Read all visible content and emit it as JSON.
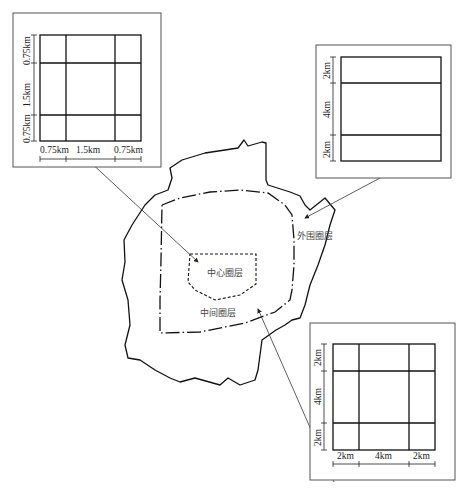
{
  "zones": {
    "center": {
      "label": "中心圈层"
    },
    "middle": {
      "label": "中间圈层"
    },
    "outer": {
      "label": "外围圈层"
    }
  },
  "grid_center": {
    "vertical": [
      "0.75km",
      "1.5km",
      "0.75km"
    ],
    "horizontal": [
      "0.75km",
      "1.5km",
      "0.75km"
    ]
  },
  "grid_outer": {
    "vertical": [
      "2km",
      "4km",
      "2km"
    ]
  },
  "grid_middle": {
    "vertical": [
      "2km",
      "4km",
      "2km"
    ],
    "horizontal": [
      "2km",
      "4km",
      "2km"
    ]
  },
  "colors": {
    "line": "#111111",
    "frame": "#555555",
    "background": "#ffffff"
  }
}
